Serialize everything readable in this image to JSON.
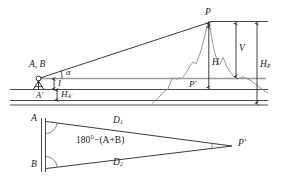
{
  "figure": {
    "colors": {
      "ink": "#1c1c1c",
      "ground_line": "#4a4a4a",
      "sight_line": "#3a3a3a",
      "horizon_line": "#9a9a9a",
      "terrain": "#8c8c8c",
      "dimension": "#2b2b2b",
      "background": "#ffffff"
    }
  },
  "upper_diagram": {
    "name": "elevation-view",
    "labels": {
      "station": "A, B",
      "station_foot": "A′",
      "target_peak": "P",
      "target_foot": "P′",
      "vertical_angle": "α",
      "instrument_height": "I",
      "station_elevation": "H",
      "station_elevation_sub": "A′",
      "height_diff": "V",
      "peak_height": "H",
      "peak_height_sub": "P",
      "peak_above_foot": "H"
    },
    "elements": [
      "sight-line",
      "horizontal-line",
      "tripod",
      "terrain-profile",
      "ground-line-upper",
      "ground-line-middle",
      "ground-line-lower",
      "dimension-V",
      "dimension-HP",
      "dimension-H",
      "dimension-I",
      "dimension-HA"
    ]
  },
  "lower_diagram": {
    "name": "plan-view-triangle",
    "labels": {
      "vertex_a": "A",
      "vertex_b": "B",
      "apex": "P′",
      "side_top": "D",
      "side_top_sub": "1",
      "side_bottom": "D",
      "side_bottom_sub": "2",
      "interior_angle": "180°−(A+B)"
    },
    "elements": [
      "baseline-AB",
      "side-D1",
      "side-D2",
      "angle-arc-A",
      "angle-arc-B",
      "angle-arc-P"
    ]
  }
}
